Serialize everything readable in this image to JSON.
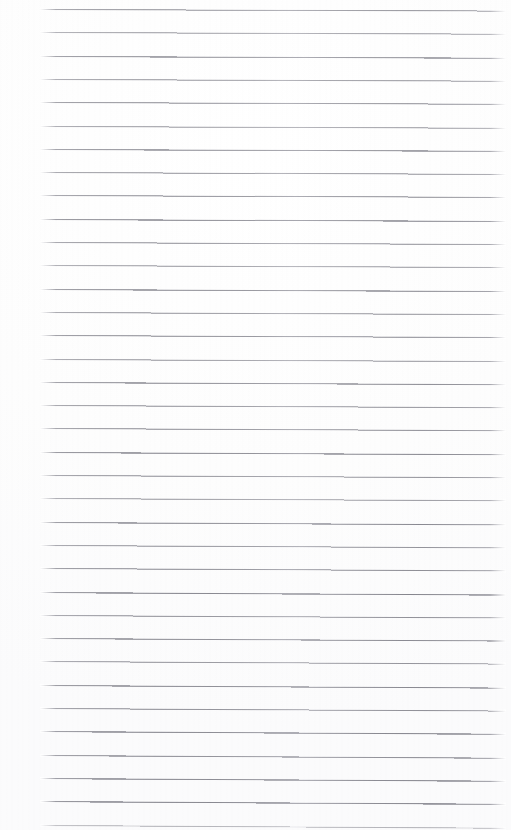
{
  "document": {
    "kind": "scanned-ruled-paper",
    "title": "Blank Ruled Notebook Page",
    "page_width": 511,
    "page_height": 830,
    "background_color": "#ffffff",
    "paper_tint": "#fdfdfd",
    "has_text_content": false,
    "visible_text": "",
    "notes": "Empty lined writing paper; no handwriting, headings, page numbers, margins rule, holes or marginalia are rendered."
  },
  "ruling": {
    "line_color": "#b4b4ba",
    "line_color_dark": "#9c9ca4",
    "line_color_light": "#d6d6dc",
    "line_count": 36,
    "line_thickness_px": 1,
    "spacing_px": 23.3,
    "first_line_y": 9.0,
    "left_x": 40,
    "right_x": 506,
    "skew_px": 2.4,
    "lines": [
      {
        "index": 1,
        "y_left": 9.0,
        "y_right": 10.6,
        "opacity": 0.78,
        "weight": 1.0
      },
      {
        "index": 2,
        "y_left": 32.3,
        "y_right": 34.0,
        "opacity": 0.7,
        "weight": 1.0
      },
      {
        "index": 3,
        "y_left": 55.6,
        "y_right": 57.3,
        "opacity": 0.82,
        "weight": 1.1
      },
      {
        "index": 4,
        "y_left": 78.9,
        "y_right": 80.6,
        "opacity": 0.74,
        "weight": 1.0
      },
      {
        "index": 5,
        "y_left": 102.2,
        "y_right": 104.0,
        "opacity": 0.8,
        "weight": 1.0
      },
      {
        "index": 6,
        "y_left": 125.5,
        "y_right": 127.3,
        "opacity": 0.72,
        "weight": 1.0
      },
      {
        "index": 7,
        "y_left": 148.8,
        "y_right": 150.6,
        "opacity": 0.84,
        "weight": 1.1
      },
      {
        "index": 8,
        "y_left": 172.1,
        "y_right": 174.0,
        "opacity": 0.76,
        "weight": 1.0
      },
      {
        "index": 9,
        "y_left": 195.4,
        "y_right": 197.3,
        "opacity": 0.81,
        "weight": 1.0
      },
      {
        "index": 10,
        "y_left": 218.7,
        "y_right": 220.6,
        "opacity": 0.88,
        "weight": 1.1
      },
      {
        "index": 11,
        "y_left": 242.0,
        "y_right": 244.0,
        "opacity": 0.79,
        "weight": 1.0
      },
      {
        "index": 12,
        "y_left": 265.3,
        "y_right": 267.3,
        "opacity": 0.73,
        "weight": 1.0
      },
      {
        "index": 13,
        "y_left": 288.6,
        "y_right": 290.6,
        "opacity": 0.85,
        "weight": 1.1
      },
      {
        "index": 14,
        "y_left": 311.9,
        "y_right": 314.0,
        "opacity": 0.77,
        "weight": 1.0
      },
      {
        "index": 15,
        "y_left": 335.2,
        "y_right": 337.3,
        "opacity": 0.83,
        "weight": 1.0
      },
      {
        "index": 16,
        "y_left": 358.5,
        "y_right": 360.6,
        "opacity": 0.75,
        "weight": 1.0
      },
      {
        "index": 17,
        "y_left": 381.8,
        "y_right": 384.0,
        "opacity": 0.86,
        "weight": 1.1
      },
      {
        "index": 18,
        "y_left": 405.1,
        "y_right": 407.3,
        "opacity": 0.78,
        "weight": 1.0
      },
      {
        "index": 19,
        "y_left": 428.4,
        "y_right": 430.6,
        "opacity": 0.82,
        "weight": 1.0
      },
      {
        "index": 20,
        "y_left": 451.7,
        "y_right": 454.0,
        "opacity": 0.89,
        "weight": 1.1
      },
      {
        "index": 21,
        "y_left": 475.0,
        "y_right": 477.3,
        "opacity": 0.8,
        "weight": 1.0
      },
      {
        "index": 22,
        "y_left": 498.3,
        "y_right": 500.6,
        "opacity": 0.74,
        "weight": 1.0
      },
      {
        "index": 23,
        "y_left": 521.6,
        "y_right": 524.0,
        "opacity": 0.87,
        "weight": 1.1
      },
      {
        "index": 24,
        "y_left": 544.9,
        "y_right": 547.3,
        "opacity": 0.79,
        "weight": 1.0
      },
      {
        "index": 25,
        "y_left": 568.2,
        "y_right": 570.6,
        "opacity": 0.84,
        "weight": 1.0
      },
      {
        "index": 26,
        "y_left": 591.5,
        "y_right": 594.0,
        "opacity": 0.9,
        "weight": 1.2
      },
      {
        "index": 27,
        "y_left": 614.8,
        "y_right": 617.3,
        "opacity": 0.81,
        "weight": 1.0
      },
      {
        "index": 28,
        "y_left": 638.1,
        "y_right": 640.6,
        "opacity": 0.86,
        "weight": 1.1
      },
      {
        "index": 29,
        "y_left": 661.4,
        "y_right": 664.0,
        "opacity": 0.78,
        "weight": 1.0
      },
      {
        "index": 30,
        "y_left": 684.7,
        "y_right": 687.3,
        "opacity": 0.88,
        "weight": 1.1
      },
      {
        "index": 31,
        "y_left": 708.0,
        "y_right": 710.6,
        "opacity": 0.83,
        "weight": 1.0
      },
      {
        "index": 32,
        "y_left": 731.3,
        "y_right": 734.0,
        "opacity": 0.91,
        "weight": 1.2
      },
      {
        "index": 33,
        "y_left": 754.6,
        "y_right": 757.3,
        "opacity": 0.85,
        "weight": 1.1
      },
      {
        "index": 34,
        "y_left": 777.9,
        "y_right": 780.6,
        "opacity": 0.9,
        "weight": 1.2
      },
      {
        "index": 35,
        "y_left": 801.2,
        "y_right": 804.0,
        "opacity": 0.92,
        "weight": 1.2
      },
      {
        "index": 36,
        "y_left": 824.5,
        "y_right": 827.3,
        "opacity": 0.55,
        "weight": 0.9
      }
    ]
  }
}
